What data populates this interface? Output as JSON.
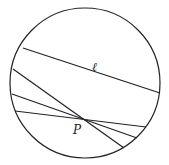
{
  "diagram": {
    "circle": {
      "cx": 85,
      "cy": 83,
      "r": 75
    },
    "lines": [
      {
        "name": "line-l",
        "x1": 23,
        "y1": 48,
        "x2": 160,
        "y2": 93
      },
      {
        "name": "line-through-p-1",
        "x1": 13,
        "y1": 69,
        "x2": 124,
        "y2": 148
      },
      {
        "name": "line-through-p-2",
        "x1": 12,
        "y1": 94,
        "x2": 137,
        "y2": 138
      },
      {
        "name": "line-through-p-3",
        "x1": 15,
        "y1": 111,
        "x2": 146,
        "y2": 127
      }
    ],
    "labels": {
      "line_label": "ℓ",
      "point_label": "P"
    },
    "colors": {
      "stroke": "#222222",
      "background": "#ffffff"
    }
  }
}
